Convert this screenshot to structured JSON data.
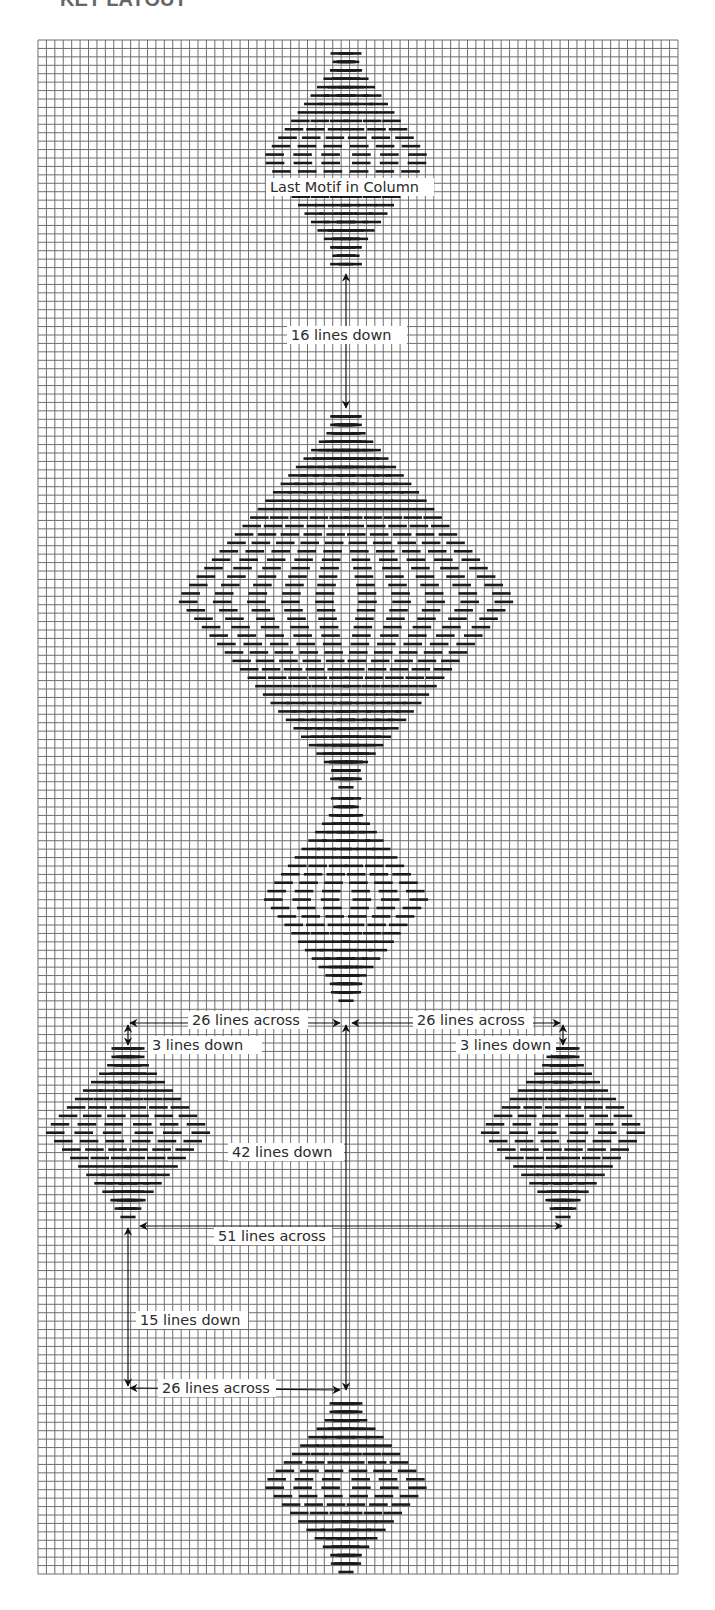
{
  "page": {
    "title_fragment": "KEY LAYOUT"
  },
  "grid": {
    "x0": 38,
    "y0": 40,
    "x1": 678,
    "y1": 1574,
    "cols": 76,
    "rows": 182,
    "line_color": "#6f6f6f",
    "bg_color": "#ffffff"
  },
  "stitch_color": "#1a1a1a",
  "motifs": [
    {
      "name": "last-motif-in-column",
      "cx": 346,
      "top": 45,
      "bottom": 272,
      "halfwidth": 87,
      "rings": 3,
      "stem_top": true
    },
    {
      "name": "large-motif",
      "cx": 346,
      "top": 408,
      "bottom": 790,
      "halfwidth": 173,
      "rings": 5,
      "stem_top": false
    },
    {
      "name": "center-motif",
      "cx": 346,
      "top": 790,
      "bottom": 1005,
      "halfwidth": 87,
      "rings": 3,
      "stem_top": true
    },
    {
      "name": "left-motif",
      "cx": 128,
      "top": 1040,
      "bottom": 1222,
      "halfwidth": 87,
      "rings": 3,
      "stem_top": false
    },
    {
      "name": "right-motif",
      "cx": 563,
      "top": 1040,
      "bottom": 1222,
      "halfwidth": 87,
      "rings": 3,
      "stem_top": false
    },
    {
      "name": "bottom-motif",
      "cx": 346,
      "top": 1395,
      "bottom": 1574,
      "halfwidth": 87,
      "rings": 3,
      "stem_top": false
    }
  ],
  "annotations": {
    "last_motif": {
      "text": "Last Motif in Column",
      "x": 266,
      "y": 178,
      "w": 168
    },
    "lines_down_16": {
      "text": "16 lines down",
      "x": 287,
      "y": 326,
      "w": 120
    },
    "lines_across_26_left": {
      "text": "26 lines across",
      "x": 188,
      "y": 1011,
      "w": 120
    },
    "lines_across_26_right": {
      "text": "26 lines across",
      "x": 413,
      "y": 1011,
      "w": 120
    },
    "lines_down_3_left": {
      "text": "3 lines down",
      "x": 148,
      "y": 1036,
      "w": 114
    },
    "lines_down_3_right": {
      "text": "3 lines down",
      "x": 456,
      "y": 1036,
      "w": 100
    },
    "lines_down_42": {
      "text": "42 lines down",
      "x": 228,
      "y": 1143,
      "w": 116
    },
    "lines_across_51": {
      "text": "51 lines across",
      "x": 214,
      "y": 1227,
      "w": 118
    },
    "lines_down_15": {
      "text": "15 lines down",
      "x": 136,
      "y": 1311,
      "w": 112
    },
    "lines_across_26_bottom": {
      "text": "26 lines across",
      "x": 158,
      "y": 1379,
      "w": 118
    }
  },
  "arrows": [
    {
      "name": "arrow-16-lines-down",
      "x1": 346,
      "y1": 274,
      "x2": 346,
      "y2": 408,
      "heads": "both"
    },
    {
      "name": "arrow-26-across-left",
      "x1": 130,
      "y1": 1023,
      "x2": 340,
      "y2": 1023,
      "heads": "both"
    },
    {
      "name": "arrow-26-across-right",
      "x1": 352,
      "y1": 1023,
      "x2": 560,
      "y2": 1023,
      "heads": "both"
    },
    {
      "name": "arrow-3-down-left",
      "x1": 128,
      "y1": 1025,
      "x2": 128,
      "y2": 1045,
      "heads": "both"
    },
    {
      "name": "arrow-3-down-right",
      "x1": 563,
      "y1": 1025,
      "x2": 563,
      "y2": 1045,
      "heads": "both"
    },
    {
      "name": "arrow-42-lines-down",
      "x1": 346,
      "y1": 1025,
      "x2": 346,
      "y2": 1390,
      "heads": "both"
    },
    {
      "name": "arrow-51-across",
      "x1": 140,
      "y1": 1226,
      "x2": 562,
      "y2": 1226,
      "heads": "both"
    },
    {
      "name": "arrow-15-lines-down",
      "x1": 128,
      "y1": 1228,
      "x2": 128,
      "y2": 1386,
      "heads": "both"
    },
    {
      "name": "arrow-26-across-bottom",
      "x1": 130,
      "y1": 1388,
      "x2": 340,
      "y2": 1390,
      "heads": "both"
    }
  ]
}
